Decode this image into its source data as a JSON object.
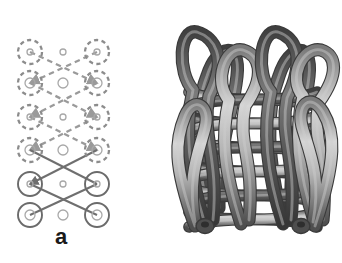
{
  "figure": {
    "caption_labels": {
      "panel_a": "a",
      "panel_b": "b"
    },
    "background_color": "#ffffff"
  },
  "panel_a": {
    "name": "schematic-weave-lattice-diagram",
    "description": "2D schematic of a tubular woven lattice: six rows of three columns of ring nodes connected by crossing diagonal segments; upper four rows drawn dashed (light gray), lower two rows drawn solid (dark gray).",
    "colors": {
      "dashed_stroke": "#9a9a9a",
      "solid_stroke": "#6f6f6f",
      "node_ring_dashed": "#8c8c8c",
      "node_ring_solid": "#6b6b6b",
      "node_inner": "#a8a8a8"
    },
    "geometry": {
      "columns_x": [
        30,
        63,
        97
      ],
      "rows_y": [
        52,
        83,
        117,
        150,
        184,
        215
      ],
      "outer_radius_side": 12,
      "inner_radius_side": 3.5,
      "center_small_radius": 4
    },
    "nodes": [
      {
        "row": 1,
        "col": "left",
        "x": 30,
        "y": 52,
        "style": "dashed",
        "outer": true,
        "inner_r": 3
      },
      {
        "row": 1,
        "col": "center",
        "x": 63,
        "y": 52,
        "style": "dashed",
        "outer": false,
        "inner_r": 3
      },
      {
        "row": 1,
        "col": "right",
        "x": 97,
        "y": 52,
        "style": "dashed",
        "outer": true,
        "inner_r": 3
      },
      {
        "row": 2,
        "col": "left",
        "x": 30,
        "y": 83,
        "style": "dashed",
        "outer": true,
        "inner_r": 5
      },
      {
        "row": 2,
        "col": "center",
        "x": 63,
        "y": 83,
        "style": "dashed",
        "outer": false,
        "inner_r": 5
      },
      {
        "row": 2,
        "col": "right",
        "x": 97,
        "y": 83,
        "style": "dashed",
        "outer": true,
        "inner_r": 5
      },
      {
        "row": 3,
        "col": "left",
        "x": 30,
        "y": 117,
        "style": "dashed",
        "outer": true,
        "inner_r": 3
      },
      {
        "row": 3,
        "col": "center",
        "x": 63,
        "y": 117,
        "style": "dashed",
        "outer": false,
        "inner_r": 3
      },
      {
        "row": 3,
        "col": "right",
        "x": 97,
        "y": 117,
        "style": "dashed",
        "outer": true,
        "inner_r": 3
      },
      {
        "row": 4,
        "col": "left",
        "x": 30,
        "y": 150,
        "style": "dashed",
        "outer": true,
        "inner_r": 5
      },
      {
        "row": 4,
        "col": "center",
        "x": 63,
        "y": 150,
        "style": "dashed",
        "outer": false,
        "inner_r": 5
      },
      {
        "row": 4,
        "col": "right",
        "x": 97,
        "y": 150,
        "style": "dashed",
        "outer": true,
        "inner_r": 5
      },
      {
        "row": 5,
        "col": "left",
        "x": 30,
        "y": 184,
        "style": "solid",
        "outer": true,
        "inner_r": 3
      },
      {
        "row": 5,
        "col": "center",
        "x": 63,
        "y": 184,
        "style": "solid",
        "outer": false,
        "inner_r": 3
      },
      {
        "row": 5,
        "col": "right",
        "x": 97,
        "y": 184,
        "style": "solid",
        "outer": true,
        "inner_r": 3
      },
      {
        "row": 6,
        "col": "left",
        "x": 30,
        "y": 215,
        "style": "solid",
        "outer": true,
        "inner_r": 5
      },
      {
        "row": 6,
        "col": "center",
        "x": 63,
        "y": 215,
        "style": "solid",
        "outer": false,
        "inner_r": 5
      },
      {
        "row": 6,
        "col": "right",
        "x": 97,
        "y": 215,
        "style": "solid",
        "outer": true,
        "inner_r": 5
      }
    ],
    "edges": [
      {
        "from": [
          30,
          52
        ],
        "to": [
          97,
          83
        ],
        "style": "dashed",
        "arrow": true
      },
      {
        "from": [
          97,
          52
        ],
        "to": [
          30,
          83
        ],
        "style": "dashed",
        "arrow": true
      },
      {
        "from": [
          30,
          83
        ],
        "to": [
          97,
          117
        ],
        "style": "dashed",
        "arrow": true
      },
      {
        "from": [
          97,
          83
        ],
        "to": [
          30,
          117
        ],
        "style": "dashed",
        "arrow": true
      },
      {
        "from": [
          30,
          117
        ],
        "to": [
          97,
          150
        ],
        "style": "dashed",
        "arrow": true
      },
      {
        "from": [
          97,
          117
        ],
        "to": [
          30,
          150
        ],
        "style": "dashed",
        "arrow": true
      },
      {
        "from": [
          30,
          150
        ],
        "to": [
          97,
          184
        ],
        "style": "solid",
        "arrow": false
      },
      {
        "from": [
          97,
          150
        ],
        "to": [
          30,
          184
        ],
        "style": "solid",
        "arrow": true
      },
      {
        "from": [
          30,
          184
        ],
        "to": [
          97,
          215
        ],
        "style": "solid",
        "arrow": false
      },
      {
        "from": [
          97,
          184
        ],
        "to": [
          30,
          215
        ],
        "style": "solid",
        "arrow": false
      }
    ]
  },
  "panel_b": {
    "name": "three-dimensional-woven-tube-render",
    "description": "3D shaded render of a cylindrical woven/braided structure made of interlocking tubular strands with looped ends projecting upward at the top and rounded terminations at the bottom.",
    "colors": {
      "tube_dark": "#4e4e4e",
      "tube_mid": "#7b7b7b",
      "tube_light": "#b4b4b4",
      "tube_highlight": "#d6d6d6",
      "outline": "#3a3a3a"
    },
    "structure": {
      "loop_count_top": 4,
      "weave_rows": 6,
      "strand_thickness_px": 11,
      "cylinder_width_px": 150,
      "cylinder_height_px": 210
    }
  }
}
